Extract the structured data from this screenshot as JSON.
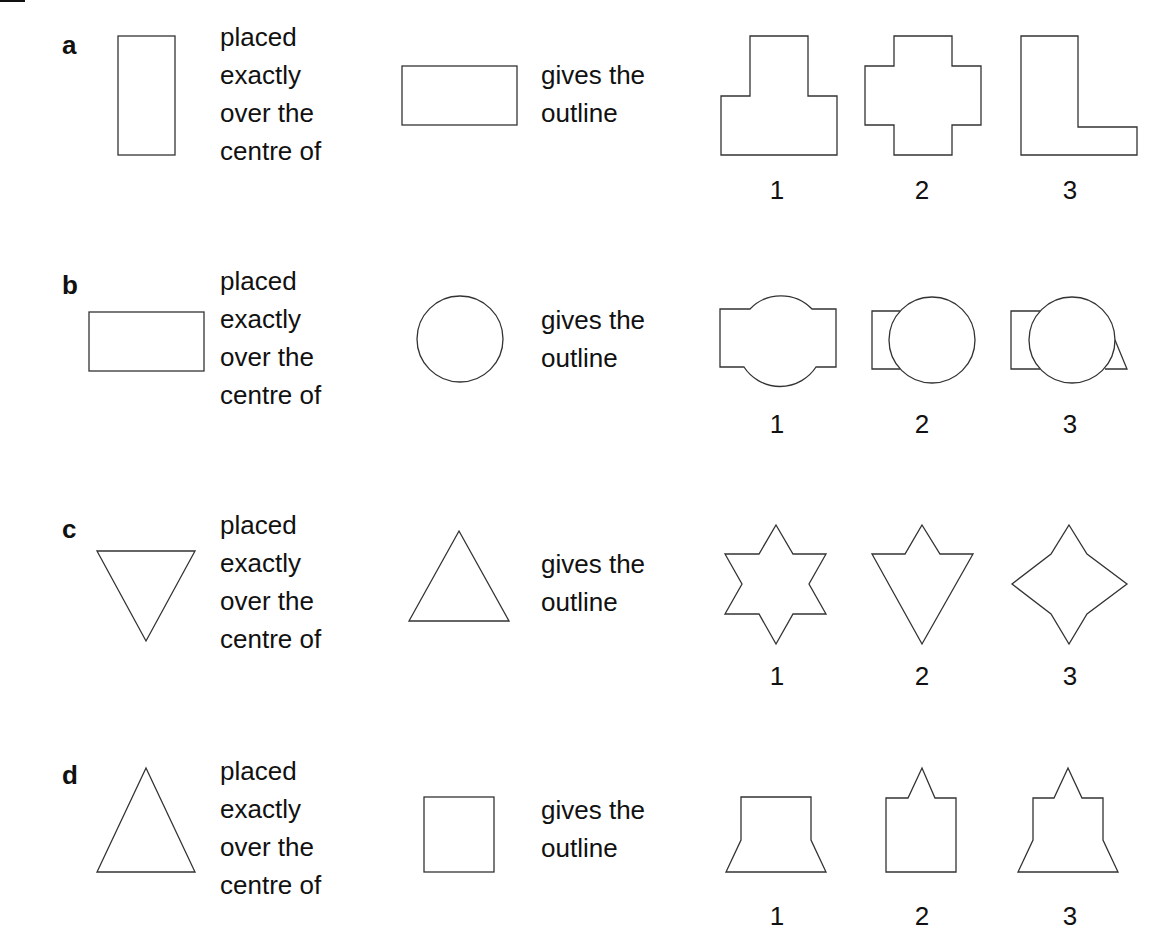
{
  "questions": [
    {
      "letter": "a",
      "first_shape": "tall rectangle",
      "phrase1": "placed\nexactly\nover the\ncentre of",
      "second_shape": "wide rectangle",
      "phrase2": "gives the\noutline",
      "options": [
        {
          "number": "1",
          "shape": "inverted T outline"
        },
        {
          "number": "2",
          "shape": "cross outline"
        },
        {
          "number": "3",
          "shape": "L outline"
        }
      ]
    },
    {
      "letter": "b",
      "first_shape": "wide rectangle",
      "phrase1": "placed\nexactly\nover the\ncentre of",
      "second_shape": "circle",
      "phrase2": "gives the\noutline",
      "options": [
        {
          "number": "1",
          "shape": "rectangle with circle bulges top and bottom"
        },
        {
          "number": "2",
          "shape": "circle offset right over rectangle"
        },
        {
          "number": "3",
          "shape": "circle over rectangle with triangle corner"
        }
      ]
    },
    {
      "letter": "c",
      "first_shape": "downward triangle",
      "phrase1": "placed\nexactly\nover the\ncentre of",
      "second_shape": "upward triangle",
      "phrase2": "gives the\noutline",
      "options": [
        {
          "number": "1",
          "shape": "six-pointed star"
        },
        {
          "number": "2",
          "shape": "downward triangle with top point"
        },
        {
          "number": "3",
          "shape": "four-pointed concave star"
        }
      ]
    },
    {
      "letter": "d",
      "first_shape": "upward triangle",
      "phrase1": "placed\nexactly\nover the\ncentre of",
      "second_shape": "square",
      "phrase2": "gives the\noutline",
      "options": [
        {
          "number": "1",
          "shape": "square with flared base"
        },
        {
          "number": "2",
          "shape": "square with top point"
        },
        {
          "number": "3",
          "shape": "square with top point and flared base"
        }
      ]
    }
  ]
}
